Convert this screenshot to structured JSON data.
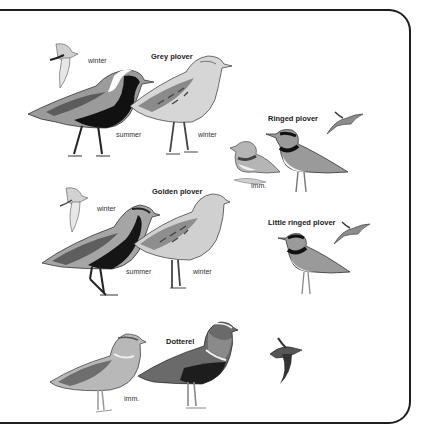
{
  "plate": {
    "species": [
      {
        "name": "Grey plover",
        "labels": [
          "winter",
          "summer",
          "winter"
        ]
      },
      {
        "name": "Ringed plover",
        "labels": [
          "imm."
        ]
      },
      {
        "name": "Golden plover",
        "labels": [
          "winter",
          "summer",
          "winter"
        ]
      },
      {
        "name": "Little ringed plover",
        "labels": []
      },
      {
        "name": "Dotterel",
        "labels": [
          "imm."
        ]
      }
    ]
  },
  "colors": {
    "frame": "#1e1e1e",
    "ink": "#1a1a1a",
    "breast_black": "#111111",
    "plumage_grey": "#8a8a8a",
    "plumage_light": "#d8d8d8",
    "background": "#ffffff"
  }
}
